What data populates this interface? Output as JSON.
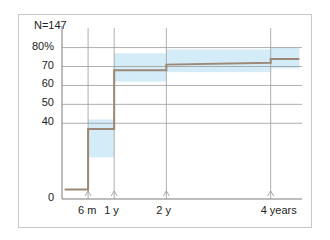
{
  "chart_data": {
    "type": "line",
    "title": "",
    "subtitle": "",
    "annotation": "N=147",
    "xlabel": "",
    "ylabel": "",
    "ylim": [
      0,
      84
    ],
    "xlim": [
      0,
      4.6
    ],
    "grid": true,
    "legend": false,
    "ytick_labels": [
      "0",
      "40",
      "50",
      "60",
      "70",
      "80%"
    ],
    "ytick_values": [
      0,
      40,
      50,
      60,
      70,
      80
    ],
    "xtick_labels": [
      "6 m",
      "1 y",
      "2 y",
      "4 years"
    ],
    "xtick_values": [
      0.5,
      1.0,
      2.0,
      4.0
    ],
    "series": [
      {
        "name": "cumulative-incidence",
        "style": "step",
        "color": "#9c8875",
        "x": [
          0.05,
          0.5,
          0.5,
          1.0,
          1.0,
          2.0,
          2.0,
          4.0,
          4.0,
          4.55
        ],
        "values": [
          5,
          5,
          37,
          37,
          68,
          68,
          71,
          72,
          74,
          74
        ]
      }
    ],
    "confidence_band": {
      "name": "95% confidence interval",
      "color": "#d4ecf7",
      "segments": [
        {
          "x_start": 0.5,
          "x_end": 1.0,
          "lower": 22,
          "upper": 42
        },
        {
          "x_start": 1.0,
          "x_end": 2.0,
          "lower": 62,
          "upper": 77
        },
        {
          "x_start": 2.0,
          "x_end": 4.0,
          "lower": 67,
          "upper": 79
        },
        {
          "x_start": 4.0,
          "x_end": 4.55,
          "lower": 69,
          "upper": 80
        }
      ]
    },
    "tick_markers": {
      "name": "censor-arrow-marker",
      "x_values": [
        0.5,
        1.0,
        2.0,
        4.0
      ]
    }
  }
}
